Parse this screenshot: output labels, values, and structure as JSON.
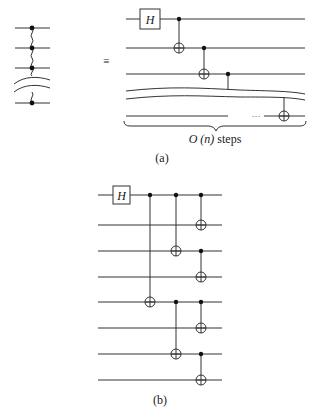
{
  "figure": {
    "left_graph": {
      "description": "linear chain of qubits connected by wavy edges with a break",
      "nodes": 4
    },
    "equivalence_symbol": "≡",
    "part_a": {
      "label": "(a)",
      "gate_label": "H",
      "brace_label_math": "O (n)",
      "brace_label_text": " steps",
      "ellipsis": "···"
    },
    "part_b": {
      "label": "(b)",
      "gate_label": "H",
      "wire_count": 8
    },
    "colors": {
      "line": "#333333",
      "dot": "#111111",
      "background": "#ffffff"
    }
  }
}
